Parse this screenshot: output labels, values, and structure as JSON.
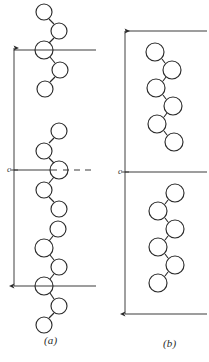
{
  "figure": {
    "type": "structural-diagram",
    "background_color": "#ffffff",
    "ink_color": "#2b2b2b",
    "panels": [
      {
        "id": "a",
        "caption": "(a)",
        "caption_x": 50,
        "caption_y": 341,
        "repeat_label": "c",
        "repeat_label_x": 10,
        "repeat_label_y": 170,
        "arrow": {
          "x": 14,
          "y_top": 48,
          "y_bottom": 286,
          "tick_y": 170
        },
        "reference_lines": [
          {
            "name": "upper-boundary",
            "x1": 14,
            "x2": 96,
            "y": 50,
            "style": "solid"
          },
          {
            "name": "middle-boundary-solid",
            "x1": 14,
            "x2": 58,
            "y": 170,
            "style": "solid"
          },
          {
            "name": "middle-boundary-dashed",
            "x1": 62,
            "x2": 96,
            "y": 170,
            "style": "dashed"
          },
          {
            "name": "lower-boundary",
            "x1": 14,
            "x2": 96,
            "y": 286,
            "style": "solid"
          }
        ],
        "chains": [
          {
            "name": "chain-upper",
            "atoms": [
              {
                "cx": 44,
                "cy": 12,
                "r": 8
              },
              {
                "cx": 59,
                "cy": 31,
                "r": 8
              },
              {
                "cx": 44,
                "cy": 50,
                "r": 9
              },
              {
                "cx": 60,
                "cy": 70,
                "r": 8
              },
              {
                "cx": 45,
                "cy": 89,
                "r": 8
              }
            ]
          },
          {
            "name": "chain-middle",
            "atoms": [
              {
                "cx": 59,
                "cy": 131,
                "r": 8
              },
              {
                "cx": 44,
                "cy": 151,
                "r": 8
              },
              {
                "cx": 59,
                "cy": 170,
                "r": 9
              },
              {
                "cx": 44,
                "cy": 190,
                "r": 8
              },
              {
                "cx": 59,
                "cy": 209,
                "r": 8
              }
            ]
          },
          {
            "name": "chain-lower",
            "atoms": [
              {
                "cx": 58,
                "cy": 229,
                "r": 8
              },
              {
                "cx": 44,
                "cy": 248,
                "r": 9
              },
              {
                "cx": 59,
                "cy": 267,
                "r": 8
              },
              {
                "cx": 44,
                "cy": 286,
                "r": 9
              },
              {
                "cx": 59,
                "cy": 306,
                "r": 8
              },
              {
                "cx": 44,
                "cy": 325,
                "r": 8
              }
            ]
          }
        ]
      },
      {
        "id": "b",
        "caption": "(b)",
        "caption_x": 169,
        "caption_y": 344,
        "repeat_label": "c",
        "repeat_label_x": 121,
        "repeat_label_y": 172,
        "arrow": {
          "x": 125,
          "y_top": 31,
          "y_bottom": 314,
          "tick_y": 172
        },
        "reference_lines": [
          {
            "name": "upper-boundary",
            "x1": 125,
            "x2": 207,
            "y": 31,
            "style": "solid"
          },
          {
            "name": "middle-boundary",
            "x1": 125,
            "x2": 207,
            "y": 172,
            "style": "solid"
          },
          {
            "name": "lower-boundary",
            "x1": 125,
            "x2": 207,
            "y": 314,
            "style": "solid"
          }
        ],
        "chains": [
          {
            "name": "chain-upper",
            "atoms": [
              {
                "cx": 155,
                "cy": 52,
                "r": 9
              },
              {
                "cx": 172,
                "cy": 70,
                "r": 9
              },
              {
                "cx": 156,
                "cy": 88,
                "r": 9
              },
              {
                "cx": 173,
                "cy": 106,
                "r": 9
              },
              {
                "cx": 157,
                "cy": 124,
                "r": 9
              },
              {
                "cx": 174,
                "cy": 142,
                "r": 9
              }
            ]
          },
          {
            "name": "chain-lower",
            "atoms": [
              {
                "cx": 175,
                "cy": 193,
                "r": 9
              },
              {
                "cx": 158,
                "cy": 211,
                "r": 9
              },
              {
                "cx": 175,
                "cy": 229,
                "r": 9
              },
              {
                "cx": 158,
                "cy": 247,
                "r": 9
              },
              {
                "cx": 175,
                "cy": 265,
                "r": 9
              },
              {
                "cx": 158,
                "cy": 283,
                "r": 9
              }
            ]
          }
        ]
      }
    ]
  }
}
